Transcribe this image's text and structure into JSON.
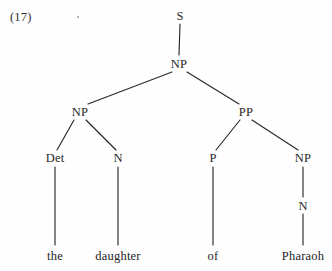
{
  "figure": {
    "example_number": "(17)",
    "sentence": "the daughter of Pharaoh",
    "ink_color": "#29292b",
    "background_color": "#fefefe"
  },
  "tree": {
    "nodes": [
      {
        "id": "s",
        "label": "S",
        "x": 180,
        "y": 16
      },
      {
        "id": "np_top",
        "label": "NP",
        "x": 179,
        "y": 64
      },
      {
        "id": "np_left",
        "label": "NP",
        "x": 80,
        "y": 112
      },
      {
        "id": "pp",
        "label": "PP",
        "x": 246,
        "y": 112
      },
      {
        "id": "det",
        "label": "Det",
        "x": 55,
        "y": 158
      },
      {
        "id": "n_left",
        "label": "N",
        "x": 118,
        "y": 158
      },
      {
        "id": "p",
        "label": "P",
        "x": 213,
        "y": 158
      },
      {
        "id": "np_right",
        "label": "NP",
        "x": 303,
        "y": 158
      },
      {
        "id": "n_right",
        "label": "N",
        "x": 303,
        "y": 206
      }
    ],
    "leaves": [
      {
        "id": "the",
        "label": "the",
        "x": 55,
        "y": 256
      },
      {
        "id": "daughter",
        "label": "daughter",
        "x": 118,
        "y": 256
      },
      {
        "id": "of",
        "label": "of",
        "x": 213,
        "y": 256
      },
      {
        "id": "pharaoh",
        "label": "Pharaoh",
        "x": 303,
        "y": 256
      }
    ],
    "edges": [
      {
        "from": "s",
        "to": "np_top",
        "x1": 180,
        "y1": 24,
        "x2": 179,
        "y2": 55
      },
      {
        "from": "np_top",
        "to": "np_left",
        "x1": 172,
        "y1": 72,
        "x2": 88,
        "y2": 104
      },
      {
        "from": "np_top",
        "to": "pp",
        "x1": 187,
        "y1": 72,
        "x2": 239,
        "y2": 104
      },
      {
        "from": "np_left",
        "to": "det",
        "x1": 74,
        "y1": 120,
        "x2": 57,
        "y2": 150
      },
      {
        "from": "np_left",
        "to": "n_left",
        "x1": 86,
        "y1": 120,
        "x2": 116,
        "y2": 150
      },
      {
        "from": "pp",
        "to": "p",
        "x1": 240,
        "y1": 120,
        "x2": 216,
        "y2": 150
      },
      {
        "from": "pp",
        "to": "np_right",
        "x1": 252,
        "y1": 120,
        "x2": 298,
        "y2": 150
      },
      {
        "from": "det",
        "to": "the",
        "x1": 55,
        "y1": 167,
        "x2": 55,
        "y2": 245
      },
      {
        "from": "n_left",
        "to": "daughter",
        "x1": 118,
        "y1": 167,
        "x2": 118,
        "y2": 245
      },
      {
        "from": "p",
        "to": "of",
        "x1": 213,
        "y1": 167,
        "x2": 213,
        "y2": 245
      },
      {
        "from": "np_right",
        "to": "n_right",
        "x1": 303,
        "y1": 167,
        "x2": 303,
        "y2": 197
      },
      {
        "from": "n_right",
        "to": "pharaoh",
        "x1": 303,
        "y1": 214,
        "x2": 303,
        "y2": 245
      }
    ],
    "artifacts": [
      {
        "id": "speck",
        "x": 78,
        "y": 17
      }
    ]
  }
}
